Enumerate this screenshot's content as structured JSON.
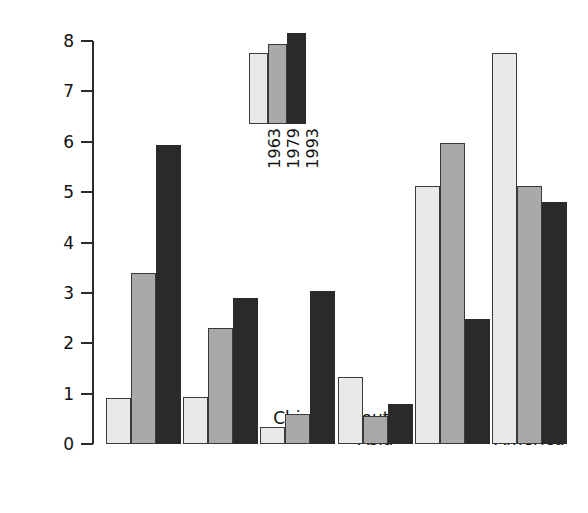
{
  "chart_data": {
    "type": "bar",
    "title": "",
    "xlabel": "",
    "ylabel": "Per cent",
    "ylim": [
      0,
      8
    ],
    "yticks": [
      0,
      1,
      2,
      3,
      4,
      5,
      6,
      7,
      8
    ],
    "ytick_labels": [
      "0",
      "1",
      "2",
      "3",
      "4",
      "5",
      "6",
      "7",
      "8"
    ],
    "grid": false,
    "legend_position": "inside-top-center",
    "categories": [
      "NIE - 1",
      "NIE - 2",
      "China",
      "South\nAsia",
      "Africa",
      "Latin\nAmerica"
    ],
    "series": [
      {
        "name": "1963",
        "color": "#e9e9e9",
        "values": [
          0.92,
          0.94,
          0.34,
          1.34,
          5.13,
          7.76
        ]
      },
      {
        "name": "1979",
        "color": "#a9a9a9",
        "values": [
          3.4,
          2.3,
          0.6,
          0.56,
          5.97,
          5.13
        ]
      },
      {
        "name": "1993",
        "color": "#2a2a2a",
        "values": [
          5.93,
          2.9,
          3.03,
          0.8,
          2.49,
          4.8
        ]
      }
    ],
    "legend_sample_values": [
      7.3,
      7.65,
      8.05
    ]
  },
  "axis": {
    "y_label": "Per cent"
  }
}
